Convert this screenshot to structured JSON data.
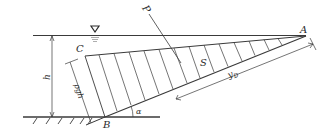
{
  "diagram": {
    "type": "hydrostatic pressure on inclined plane",
    "labels": {
      "point_a": "A",
      "point_b": "B",
      "point_c": "C",
      "force": "P",
      "area": "S",
      "depth": "h",
      "pressure": "ρgh",
      "angle": "α",
      "center_distance": "y",
      "center_distance_sub": "D"
    },
    "symbols": {
      "free_surface": "water-surface-triangle"
    },
    "colors": {
      "line": "#3a3a3a",
      "background": "#ffffff"
    }
  }
}
